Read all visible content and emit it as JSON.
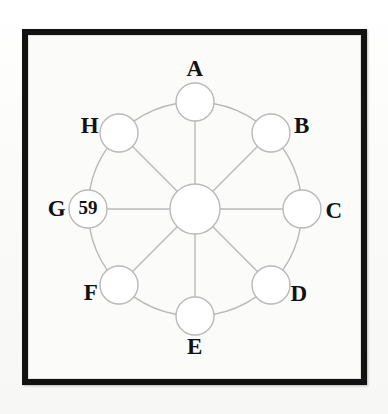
{
  "figure": {
    "kind": "wheel-graph",
    "background_color": "#fdfdfb",
    "frame_color": "#121212",
    "edge_color": "#b9b9b9",
    "node_fill": "#ffffff",
    "label_color": "#111111"
  },
  "geometry": {
    "center_x": 195,
    "center_y": 209,
    "ring_radius": 107,
    "node_radius": 19,
    "hub_radius": 25
  },
  "hub": {
    "name": "hub",
    "label": "",
    "value": "",
    "cx": 195,
    "cy": 209,
    "r": 25
  },
  "nodes": [
    {
      "id": "A",
      "label": "A",
      "value": "",
      "angle_deg": -90,
      "cx": 195,
      "cy": 102,
      "r": 19,
      "label_x": 195,
      "label_y": 71
    },
    {
      "id": "B",
      "label": "B",
      "value": "",
      "angle_deg": -45,
      "cx": 271,
      "cy": 133,
      "r": 19,
      "label_x": 302,
      "label_y": 128
    },
    {
      "id": "C",
      "label": "C",
      "value": "",
      "angle_deg": 0,
      "cx": 302,
      "cy": 209,
      "r": 19,
      "label_x": 334,
      "label_y": 213
    },
    {
      "id": "D",
      "label": "D",
      "value": "",
      "angle_deg": 45,
      "cx": 271,
      "cy": 285,
      "r": 19,
      "label_x": 299,
      "label_y": 296
    },
    {
      "id": "E",
      "label": "E",
      "value": "",
      "angle_deg": 90,
      "cx": 195,
      "cy": 316,
      "r": 19,
      "label_x": 195,
      "label_y": 349
    },
    {
      "id": "F",
      "label": "F",
      "value": "",
      "angle_deg": 135,
      "cx": 119,
      "cy": 285,
      "r": 19,
      "label_x": 91,
      "label_y": 295
    },
    {
      "id": "G",
      "label": "G",
      "value": "59",
      "angle_deg": 180,
      "cx": 88,
      "cy": 209,
      "r": 19,
      "label_x": 57,
      "label_y": 211
    },
    {
      "id": "H",
      "label": "H",
      "value": "",
      "angle_deg": -135,
      "cx": 119,
      "cy": 133,
      "r": 19,
      "label_x": 90,
      "label_y": 128
    }
  ],
  "ring_edges": [
    {
      "from": "A",
      "to": "B"
    },
    {
      "from": "B",
      "to": "C"
    },
    {
      "from": "C",
      "to": "D"
    },
    {
      "from": "D",
      "to": "E"
    },
    {
      "from": "E",
      "to": "F"
    },
    {
      "from": "F",
      "to": "G"
    },
    {
      "from": "G",
      "to": "H"
    },
    {
      "from": "H",
      "to": "A"
    }
  ],
  "spoke_edges": [
    {
      "from": "hub",
      "to": "A"
    },
    {
      "from": "hub",
      "to": "B"
    },
    {
      "from": "hub",
      "to": "C"
    },
    {
      "from": "hub",
      "to": "D"
    },
    {
      "from": "hub",
      "to": "E"
    },
    {
      "from": "hub",
      "to": "F"
    },
    {
      "from": "hub",
      "to": "G"
    },
    {
      "from": "hub",
      "to": "H"
    }
  ],
  "labels": {
    "A": "A",
    "B": "B",
    "C": "C",
    "D": "D",
    "E": "E",
    "F": "F",
    "G": "G",
    "H": "H"
  },
  "values": {
    "G": "59"
  }
}
